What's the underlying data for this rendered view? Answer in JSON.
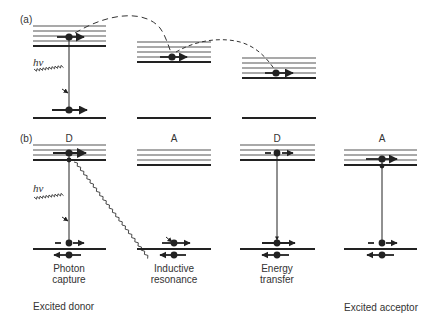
{
  "figure": {
    "panel_a_label": "(a)",
    "panel_b_label": "(b)",
    "photon_symbol": "hν",
    "panel_b_headers": [
      "D",
      "A",
      "D",
      "A"
    ],
    "step_labels": [
      {
        "line1": "Photon",
        "line2": "capture"
      },
      {
        "line1": "Inductive",
        "line2": "resonance"
      },
      {
        "line1": "Energy",
        "line2": "transfer"
      }
    ],
    "footer_left": "Excited donor",
    "footer_right": "Excited acceptor",
    "colors": {
      "ink": "#222222",
      "level_line": "#555555",
      "background": "#ffffff"
    }
  }
}
